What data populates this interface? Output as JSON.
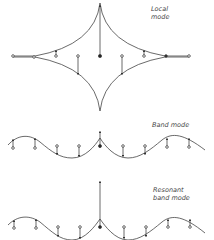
{
  "figure": {
    "panels": [
      {
        "id": "local",
        "label_line1": "Local",
        "label_line2": "mode"
      },
      {
        "id": "band",
        "label_line1": "Band mode",
        "label_line2": ""
      },
      {
        "id": "resonant",
        "label_line1": "Resonant",
        "label_line2": "band mode"
      }
    ]
  },
  "colors": {
    "ink": "#333333",
    "background": "#ffffff"
  }
}
